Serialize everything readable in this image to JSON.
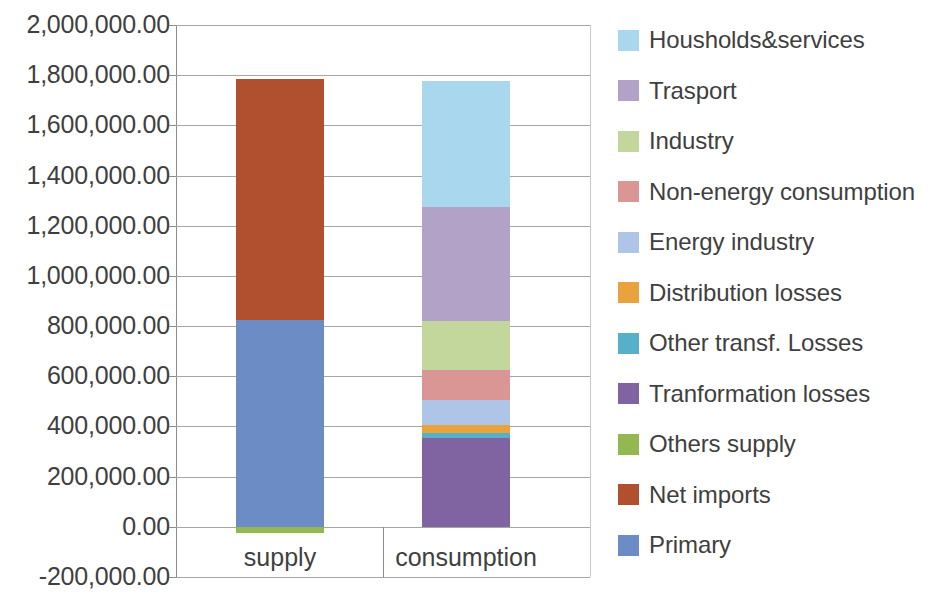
{
  "chart_data": {
    "type": "bar",
    "stacked": true,
    "title": "",
    "subtitle": "",
    "xlabel": "",
    "ylabel": "",
    "categories": [
      "supply",
      "consumption"
    ],
    "ylim": [
      -200000,
      2000000
    ],
    "y_tick_step": 200000,
    "y_tick_labels": [
      "2,000,000.00",
      "1,800,000.00",
      "1,600,000.00",
      "1,400,000.00",
      "1,200,000.00",
      "1,000,000.00",
      "800,000.00",
      "600,000.00",
      "400,000.00",
      "200,000.00",
      "0.00",
      "-200,000.00"
    ],
    "y_tick_values": [
      2000000,
      1800000,
      1600000,
      1400000,
      1200000,
      1000000,
      800000,
      600000,
      400000,
      200000,
      0,
      -200000
    ],
    "grid": true,
    "legend_position": "right",
    "series": [
      {
        "name": "Housholds&services",
        "color": "#a9d7ee",
        "values": [
          0,
          500000
        ]
      },
      {
        "name": "Trasport",
        "color": "#b3a2c8",
        "values": [
          0,
          455000
        ]
      },
      {
        "name": "Industry",
        "color": "#c3d69b",
        "values": [
          0,
          195000
        ]
      },
      {
        "name": "Non-energy consumption",
        "color": "#d99694",
        "values": [
          0,
          120000
        ]
      },
      {
        "name": "Energy industry",
        "color": "#aec5e8",
        "values": [
          0,
          100000
        ]
      },
      {
        "name": "Distribution losses",
        "color": "#e8a33d",
        "values": [
          0,
          30000
        ]
      },
      {
        "name": "Other transf. Losses",
        "color": "#55b0c8",
        "values": [
          0,
          20000
        ]
      },
      {
        "name": "Tranformation losses",
        "color": "#8064a2",
        "values": [
          0,
          355000
        ]
      },
      {
        "name": "Others supply",
        "color": "#92b84f",
        "values": [
          -25000,
          0
        ]
      },
      {
        "name": "Net imports",
        "color": "#b1502f",
        "values": [
          960000,
          0
        ]
      },
      {
        "name": "Primary",
        "color": "#6b8cc4",
        "values": [
          825000,
          0
        ]
      }
    ],
    "stack_totals": {
      "supply": 1785000,
      "consumption": 1775000
    }
  },
  "legend": {
    "items": [
      {
        "label": "Housholds&services",
        "color": "#a9d7ee"
      },
      {
        "label": "Trasport",
        "color": "#b3a2c8"
      },
      {
        "label": "Industry",
        "color": "#c3d69b"
      },
      {
        "label": "Non-energy consumption",
        "color": "#d99694"
      },
      {
        "label": "Energy industry",
        "color": "#aec5e8"
      },
      {
        "label": "Distribution losses",
        "color": "#e8a33d"
      },
      {
        "label": "Other transf. Losses",
        "color": "#55b0c8"
      },
      {
        "label": "Tranformation losses",
        "color": "#8064a2"
      },
      {
        "label": "Others supply",
        "color": "#92b84f"
      },
      {
        "label": "Net imports",
        "color": "#b1502f"
      },
      {
        "label": "Primary",
        "color": "#6b8cc4"
      }
    ]
  }
}
